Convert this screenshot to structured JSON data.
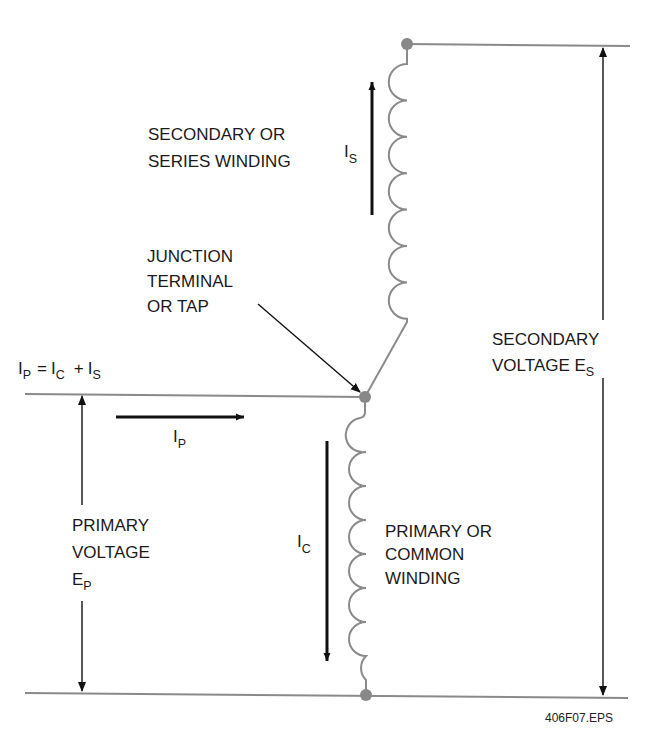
{
  "diagram": {
    "figure_id": "406F07.EPS",
    "colors": {
      "wire": "#8a8a8a",
      "arrow": "#111111",
      "terminal": "#888888",
      "text": "#1a1a1a"
    },
    "labels": {
      "secondary_winding": {
        "line1": "SECONDARY OR",
        "line2": "SERIES WINDING"
      },
      "junction": {
        "line1": "JUNCTION",
        "line2": "TERMINAL",
        "line3": "OR TAP"
      },
      "current_equation": {
        "ip_main": "I",
        "ip_sub": "P",
        "eq": "=",
        "ic_main": "I",
        "ic_sub": "C",
        "plus": "+",
        "is_main": "I",
        "is_sub": "S"
      },
      "secondary_voltage": {
        "line1": "SECONDARY",
        "line2_main": "VOLTAGE E",
        "line2_sub": "S"
      },
      "primary_voltage": {
        "line1": "PRIMARY",
        "line2": "VOLTAGE",
        "line3_main": "E",
        "line3_sub": "P"
      },
      "primary_winding": {
        "line1": "PRIMARY OR",
        "line2": "COMMON",
        "line3": "WINDING"
      },
      "current_is": {
        "main": "I",
        "sub": "S"
      },
      "current_ip": {
        "main": "I",
        "sub": "P"
      },
      "current_ic": {
        "main": "I",
        "sub": "C"
      }
    },
    "components": {
      "secondary_coil_turns": 7,
      "primary_coil_turns": 8,
      "terminals": [
        "top-terminal",
        "junction-terminal",
        "bottom-terminal"
      ]
    }
  }
}
